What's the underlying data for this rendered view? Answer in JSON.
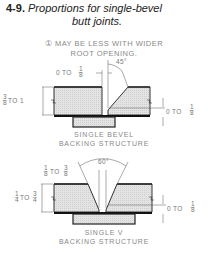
{
  "figure": {
    "number": "4-9.",
    "title_line1": "Proportions for single-bevel",
    "title_line2": "butt joints."
  },
  "note": {
    "marker": "①",
    "line1": "MAY BE LESS WITH WIDER",
    "line2": "ROOT OPENING."
  },
  "diagram_top": {
    "caption_line1": "SINGLE BEVEL",
    "caption_line2": "BACKING STRUCTURE",
    "angle": "45°",
    "gap_label": "0 TO",
    "gap_frac_num": "1",
    "gap_frac_den": "8",
    "thickness_frac_num": "3",
    "thickness_frac_den": "8",
    "thickness_label": "TO 1",
    "root_label": "0 TO",
    "root_frac_num": "1",
    "root_frac_den": "8"
  },
  "diagram_bottom": {
    "caption_line1": "SINGLE V",
    "caption_line2": "BACKING STRUCTURE",
    "angle": "60°",
    "gap_frac_a_num": "1",
    "gap_frac_a_den": "8",
    "gap_label": "TO",
    "gap_frac_b_num": "3",
    "gap_frac_b_den": "8",
    "thickness_frac_a_num": "1",
    "thickness_frac_a_den": "4",
    "thickness_label": "TO",
    "thickness_frac_b_num": "3",
    "thickness_frac_b_den": "4",
    "root_label": "0 TO",
    "root_frac_num": "1",
    "root_frac_den": "8"
  }
}
